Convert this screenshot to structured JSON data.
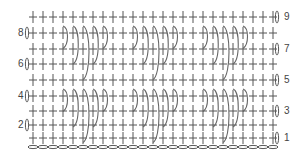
{
  "diagram": {
    "type": "crochet-stitch-chart",
    "colors": {
      "stitch": "#555555",
      "arc": "#666666",
      "label": "#444444",
      "background": "#ffffff"
    },
    "columns": 25,
    "col_start_x": 33,
    "col_spacing": 10,
    "rows": [
      {
        "number": 1,
        "y": 138,
        "label_side": "right",
        "label": "1"
      },
      {
        "number": 2,
        "y": 125,
        "label_side": "left",
        "label": "2"
      },
      {
        "number": 3,
        "y": 111,
        "label_side": "right",
        "label": "3"
      },
      {
        "number": 4,
        "y": 96,
        "label_side": "left",
        "label": "4"
      },
      {
        "number": 5,
        "y": 80,
        "label_side": "right",
        "label": "5"
      },
      {
        "number": 6,
        "y": 64,
        "label_side": "left",
        "label": "6"
      },
      {
        "number": 7,
        "y": 49,
        "label_side": "right",
        "label": "7"
      },
      {
        "number": 8,
        "y": 33,
        "label_side": "left",
        "label": "8"
      },
      {
        "number": 9,
        "y": 17,
        "label_side": "right",
        "label": "9"
      }
    ],
    "foundation_chain": {
      "y": 147,
      "count": 25
    },
    "post_stitch_groups": {
      "start_columns": [
        3,
        10,
        17
      ],
      "arc_rows": [
        33,
        96
      ],
      "arc_lengths_in_rows": [
        1,
        2,
        3,
        2,
        1
      ]
    },
    "symbols": {
      "single-crochet": "+",
      "chain": "oval",
      "turning-chain": "vertical-oval",
      "post-stitch": "arc"
    }
  }
}
